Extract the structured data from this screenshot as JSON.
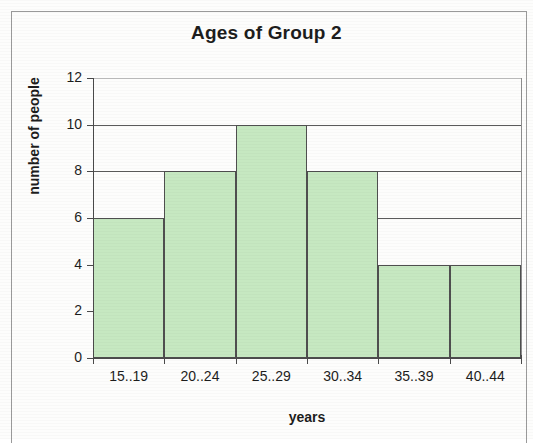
{
  "chart_data": {
    "type": "bar",
    "title": "Ages of Group 2",
    "xlabel": "years",
    "ylabel": "number of people",
    "categories": [
      "15..19",
      "20..24",
      "25..29",
      "30..34",
      "35..39",
      "40..44"
    ],
    "values": [
      6,
      8,
      10,
      8,
      4,
      4
    ],
    "ylim": [
      0,
      12
    ],
    "ytick_labels": [
      "0",
      "2",
      "4",
      "6",
      "8",
      "10",
      "12"
    ],
    "ytick_values": [
      0,
      2,
      4,
      6,
      8,
      10,
      12
    ],
    "grid": "horizontal",
    "legend": "none",
    "bar_fill_color": "#c6e8c1",
    "bar_border_color": "#4f4f4f",
    "axis_color": "#4a4a4a",
    "gridline_color": "#5b5b5b",
    "text_color": "#1d1d1d"
  }
}
